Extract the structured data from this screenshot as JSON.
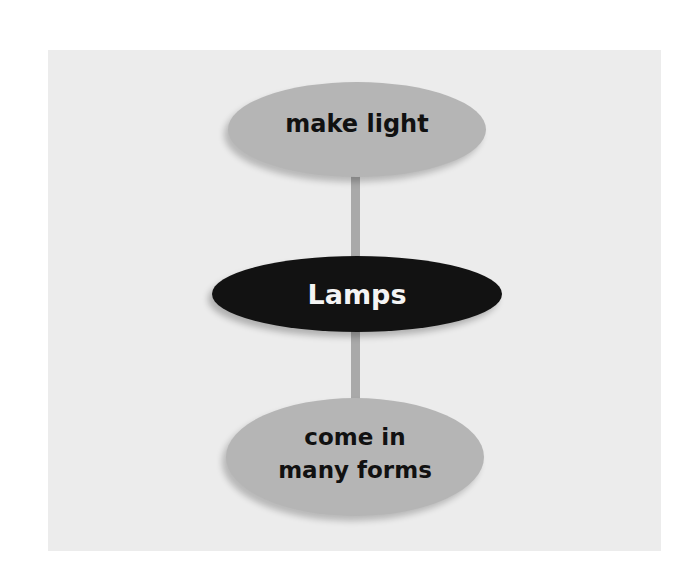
{
  "diagram": {
    "type": "concept-map",
    "center": {
      "label": "Lamps",
      "fill": "#121212",
      "text_color": "#f4f4f4"
    },
    "nodes": [
      {
        "id": "top",
        "label": "make light",
        "fill": "#b5b5b5",
        "text_color": "#111111"
      },
      {
        "id": "bottom",
        "label": "come in many forms",
        "fill": "#b5b5b5",
        "text_color": "#111111"
      }
    ],
    "edges": [
      {
        "from": "Lamps",
        "to": "make light"
      },
      {
        "from": "Lamps",
        "to": "come in many forms"
      }
    ],
    "colors": {
      "panel": "#ececec",
      "connector": "#a9a9a9"
    }
  }
}
